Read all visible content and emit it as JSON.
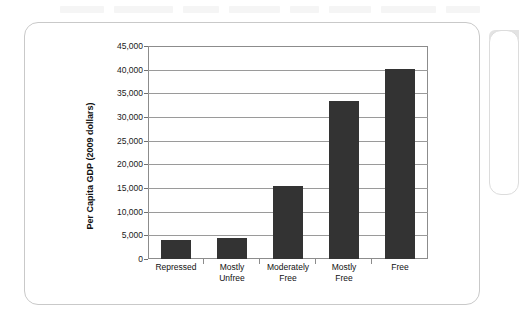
{
  "figure": {
    "card_label": "gdp-economic-freedom-figure"
  },
  "chart_data": {
    "type": "bar",
    "title": "",
    "subtitle": "",
    "xlabel": "",
    "ylabel": "Per Capita GDP (2009 dollars)",
    "categories": [
      "Repressed",
      "Mostly Unfree",
      "Moderately Free",
      "Mostly Free",
      "Free"
    ],
    "category_lines": [
      [
        "Repressed",
        ""
      ],
      [
        "Mostly",
        "Unfree"
      ],
      [
        "Moderately",
        "Free"
      ],
      [
        "Mostly",
        "Free"
      ],
      [
        "Free",
        ""
      ]
    ],
    "values": [
      4000,
      4400,
      15400,
      33300,
      40100
    ],
    "ylim": [
      0,
      45000
    ],
    "ytick_step": 5000,
    "ytick_labels": [
      "45,000",
      "40,000",
      "35,000",
      "30,000",
      "25,000",
      "20,000",
      "15,000",
      "10,000",
      "5,000",
      "0"
    ],
    "ytick_values": [
      45000,
      40000,
      35000,
      30000,
      25000,
      20000,
      15000,
      10000,
      5000,
      0
    ],
    "grid": true,
    "legend": "none",
    "bar_color": "#333333",
    "grid_color": "#9a9a9a",
    "axis_color": "#8c8c8c"
  }
}
